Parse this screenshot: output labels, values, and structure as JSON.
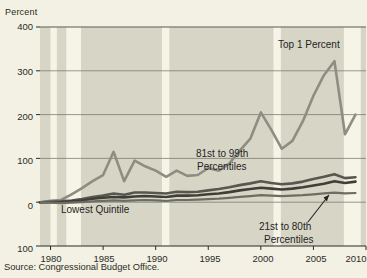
{
  "figure": {
    "axis_unit_label": "Percent",
    "source_note": "Source: Congressional Budget Office.",
    "background_color": "#f3f1e3",
    "plot_background_color": "#d7d6c6",
    "recession_band_color": "#f6f4e6"
  },
  "annotations": {
    "top1": "Top 1 Percent",
    "p81_99_line1": "81st to 99th",
    "p81_99_line2": "Percentiles",
    "lowest_quintile": "Lowest Quintile",
    "p21_80_line1": "21st to 80th",
    "p21_80_line2": "Percentiles"
  },
  "yticks": {
    "t400": "400",
    "t300": "300",
    "t200": "200",
    "t100": "100",
    "t0": "0",
    "tm100": "100"
  },
  "xticks": {
    "x1980": "1980",
    "x1985": "1985",
    "x1990": "1990",
    "x1995": "1995",
    "x2000": "2000",
    "x2005": "2005",
    "x2010": "2010"
  },
  "chart_data": {
    "type": "line",
    "title": "",
    "subtitle": "",
    "xlabel": "",
    "ylabel": "Percent",
    "xlim": [
      1979,
      2010
    ],
    "ylim": [
      -100,
      400
    ],
    "ytick_values": [
      -100,
      0,
      100,
      200,
      300,
      400
    ],
    "xtick_values": [
      1980,
      1985,
      1990,
      1995,
      2000,
      2005,
      2010
    ],
    "grid": "horizontal",
    "legend": "inline-annotations",
    "x": [
      1979,
      1980,
      1981,
      1982,
      1983,
      1984,
      1985,
      1986,
      1987,
      1988,
      1989,
      1990,
      1991,
      1992,
      1993,
      1994,
      1995,
      1996,
      1997,
      1998,
      1999,
      2000,
      2001,
      2002,
      2003,
      2004,
      2005,
      2006,
      2007,
      2008,
      2009
    ],
    "series": [
      {
        "name": "Top 1 Percent",
        "color": "#8d8d82",
        "width": 2.6,
        "values": [
          0,
          3,
          5,
          18,
          32,
          48,
          62,
          115,
          48,
          95,
          82,
          72,
          58,
          72,
          60,
          62,
          78,
          72,
          88,
          118,
          145,
          205,
          165,
          122,
          140,
          185,
          243,
          290,
          322,
          155,
          200
        ]
      },
      {
        "name": "81st to 99th Percentiles",
        "color": "#57574f",
        "width": 2.6,
        "values": [
          0,
          1,
          2,
          4,
          7,
          12,
          15,
          20,
          17,
          22,
          22,
          21,
          20,
          24,
          23,
          24,
          27,
          30,
          34,
          39,
          43,
          48,
          44,
          41,
          43,
          47,
          53,
          58,
          64,
          55,
          57
        ]
      },
      {
        "name": "21st to 80th Percentiles",
        "color": "#3f3f3a",
        "width": 2.6,
        "values": [
          0,
          0,
          0,
          2,
          4,
          8,
          10,
          12,
          11,
          13,
          14,
          13,
          12,
          15,
          15,
          16,
          18,
          20,
          23,
          27,
          30,
          33,
          31,
          29,
          31,
          34,
          38,
          42,
          48,
          44,
          47
        ]
      },
      {
        "name": "Lowest Quintile",
        "color": "#6d6d63",
        "width": 2.2,
        "values": [
          0,
          -1,
          -2,
          -1,
          0,
          2,
          3,
          4,
          3,
          4,
          5,
          4,
          3,
          5,
          5,
          6,
          7,
          8,
          10,
          12,
          14,
          16,
          15,
          14,
          15,
          16,
          18,
          20,
          22,
          20,
          21
        ]
      }
    ],
    "recession_bands": [
      [
        1980.0,
        1980.6
      ],
      [
        1981.5,
        1982.9
      ],
      [
        1990.6,
        1991.3
      ],
      [
        2001.2,
        2001.9
      ],
      [
        2007.9,
        2009.5
      ]
    ]
  }
}
